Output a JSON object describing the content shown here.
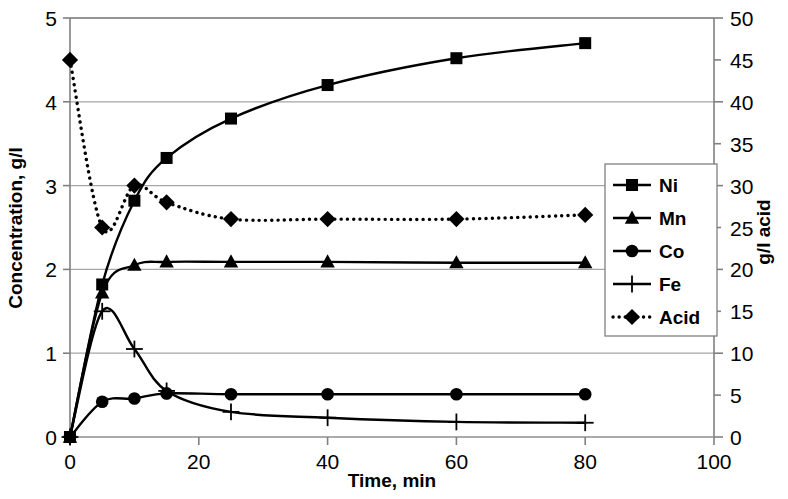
{
  "chart_data": {
    "type": "line",
    "title": "",
    "xlabel": "Time, min",
    "ylabel": "Concentration, g/l",
    "y2label": "g/l acid",
    "xlim": [
      0,
      100
    ],
    "ylim": [
      0,
      5
    ],
    "y2lim": [
      0,
      50
    ],
    "xticks": [
      0,
      20,
      40,
      60,
      80,
      100
    ],
    "xtick_labels": [
      "0",
      "20",
      "40",
      "60",
      "80",
      "100"
    ],
    "yticks": [
      0,
      1,
      2,
      3,
      4,
      5
    ],
    "ytick_labels": [
      "0",
      "1",
      "2",
      "3",
      "4",
      "5"
    ],
    "y2ticks": [
      0,
      5,
      10,
      15,
      20,
      25,
      30,
      35,
      40,
      45,
      50
    ],
    "y2tick_labels": [
      "0",
      "5",
      "10",
      "15",
      "20",
      "25",
      "30",
      "35",
      "40",
      "45",
      "50"
    ],
    "grid": true,
    "legend_position": "right-middle",
    "series": [
      {
        "name": "Ni",
        "marker": "square",
        "linestyle": "solid",
        "axis": "left",
        "x": [
          0,
          5,
          10,
          15,
          25,
          40,
          60,
          80
        ],
        "values": [
          0.0,
          1.82,
          2.82,
          3.33,
          3.8,
          4.2,
          4.52,
          4.7
        ]
      },
      {
        "name": "Mn",
        "marker": "triangle",
        "linestyle": "solid",
        "axis": "left",
        "x": [
          0,
          5,
          10,
          15,
          25,
          40,
          60,
          80
        ],
        "values": [
          0.0,
          1.72,
          2.05,
          2.09,
          2.09,
          2.09,
          2.08,
          2.08
        ]
      },
      {
        "name": "Co",
        "marker": "circle",
        "linestyle": "solid",
        "axis": "left",
        "x": [
          0,
          5,
          10,
          15,
          25,
          40,
          60,
          80
        ],
        "values": [
          0.0,
          0.42,
          0.46,
          0.52,
          0.51,
          0.51,
          0.51,
          0.51
        ]
      },
      {
        "name": "Fe",
        "marker": "plus",
        "linestyle": "solid",
        "axis": "left",
        "x": [
          0,
          5,
          10,
          15,
          25,
          40,
          60,
          80
        ],
        "values": [
          0.0,
          1.5,
          1.05,
          0.55,
          0.3,
          0.23,
          0.18,
          0.17
        ]
      },
      {
        "name": "Acid",
        "marker": "diamond",
        "linestyle": "dotted",
        "axis": "right",
        "x": [
          0,
          5,
          10,
          15,
          25,
          40,
          60,
          80
        ],
        "values": [
          45.0,
          25.0,
          30.0,
          28.0,
          26.0,
          26.0,
          26.0,
          26.5
        ]
      }
    ]
  },
  "legend": {
    "entries": [
      {
        "label": "Ni",
        "marker": "square",
        "linestyle": "solid"
      },
      {
        "label": "Mn",
        "marker": "triangle",
        "linestyle": "solid"
      },
      {
        "label": "Co",
        "marker": "circle",
        "linestyle": "solid"
      },
      {
        "label": "Fe",
        "marker": "plus",
        "linestyle": "solid"
      },
      {
        "label": "Acid",
        "marker": "diamond",
        "linestyle": "dotted"
      }
    ]
  },
  "colors": {
    "series": "#000000",
    "grid": "#a6a6a6",
    "axis": "#808080",
    "background": "#ffffff"
  }
}
